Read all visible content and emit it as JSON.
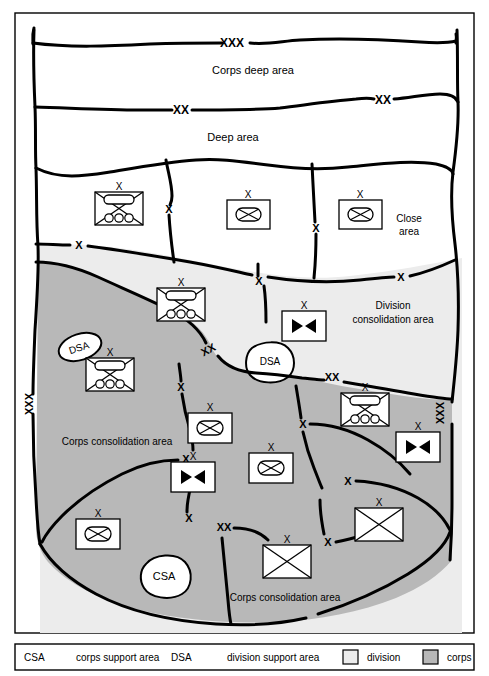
{
  "figure": {
    "background_color": "#ffffff",
    "border_color": "#000000"
  },
  "colors": {
    "division_fill": "#ececec",
    "corps_fill": "#b8b8b8",
    "deep_fill": "#ffffff",
    "line": "#000000",
    "text": "#000000",
    "symbol_fill": "#ffffff"
  },
  "area_labels": [
    {
      "id": "corps-deep-area",
      "text": "Corps deep area",
      "x": 253,
      "y": 70,
      "size": 11
    },
    {
      "id": "deep-area",
      "text": "Deep area",
      "x": 233,
      "y": 137,
      "size": 11
    },
    {
      "id": "close-area-line1",
      "text": "Close",
      "x": 409,
      "y": 219,
      "size": 10
    },
    {
      "id": "close-area-line2",
      "text": "area",
      "x": 409,
      "y": 232,
      "size": 10
    },
    {
      "id": "division-consolidation-line1",
      "text": "Division",
      "x": 393,
      "y": 306,
      "size": 10
    },
    {
      "id": "division-consolidation-line2",
      "text": "consolidation area",
      "x": 393,
      "y": 320,
      "size": 10
    },
    {
      "id": "corps-consolidation-left",
      "text": "Corps consolidation area",
      "x": 117,
      "y": 441,
      "size": 10
    },
    {
      "id": "corps-consolidation-bottom",
      "text": "Corps consolidation area",
      "x": 285,
      "y": 597,
      "size": 10
    }
  ],
  "support_area_blobs": [
    {
      "id": "dsa-left",
      "label": "DSA",
      "cx": 80,
      "cy": 347,
      "rx": 22,
      "ry": 13,
      "rotate": -18
    },
    {
      "id": "dsa-center",
      "label": "DSA",
      "cx": 270,
      "cy": 361,
      "rx": 24,
      "ry": 17,
      "rotate": 0
    },
    {
      "id": "csa-bottom",
      "label": "CSA",
      "cx": 164,
      "cy": 575,
      "rx": 25,
      "ry": 19,
      "rotate": 0
    }
  ],
  "boundary_markers": [
    {
      "id": "xxx-top",
      "text": "XXX",
      "x": 232,
      "y": 43,
      "size": 11,
      "bold": true,
      "rotate": 0
    },
    {
      "id": "xx-deep-left",
      "text": "XX",
      "x": 180,
      "y": 109,
      "size": 11,
      "bold": true,
      "rotate": 0
    },
    {
      "id": "xx-deep-right",
      "text": "XX",
      "x": 381,
      "y": 101,
      "size": 11,
      "bold": true,
      "rotate": 0
    },
    {
      "id": "x-close-left-bdy",
      "text": "X",
      "x": 168,
      "y": 209,
      "size": 10,
      "bold": true,
      "rotate": 0
    },
    {
      "id": "x-close-right-bdy",
      "text": "X",
      "x": 317,
      "y": 228,
      "size": 10,
      "bold": true,
      "rotate": 0
    },
    {
      "id": "x-close-leftedge",
      "text": "X",
      "x": 78,
      "y": 245,
      "size": 10,
      "bold": true,
      "rotate": 0
    },
    {
      "id": "x-div-mid",
      "text": "X",
      "x": 258,
      "y": 282,
      "size": 10,
      "bold": true,
      "rotate": 0
    },
    {
      "id": "x-div-right",
      "text": "X",
      "x": 400,
      "y": 278,
      "size": 10,
      "bold": true,
      "rotate": 0
    },
    {
      "id": "xx-div-left",
      "text": "XX",
      "x": 209,
      "y": 350,
      "size": 10,
      "bold": true,
      "rotate": 0
    },
    {
      "id": "xx-div-right",
      "text": "XX",
      "x": 330,
      "y": 377,
      "size": 10,
      "bold": true,
      "rotate": 0
    },
    {
      "id": "x-corps-left-vert",
      "text": "X",
      "x": 181,
      "y": 387,
      "size": 10,
      "bold": true,
      "rotate": 0
    },
    {
      "id": "x-corps-mid",
      "text": "X",
      "x": 302,
      "y": 425,
      "size": 10,
      "bold": true,
      "rotate": 0
    },
    {
      "id": "x-corps-mid2",
      "text": "X",
      "x": 185,
      "y": 460,
      "size": 10,
      "bold": true,
      "rotate": 0
    },
    {
      "id": "x-corps-lower",
      "text": "X",
      "x": 347,
      "y": 481,
      "size": 10,
      "bold": true,
      "rotate": 0
    },
    {
      "id": "x-corps-bottom-left",
      "text": "X",
      "x": 188,
      "y": 518,
      "size": 10,
      "bold": true,
      "rotate": 0
    },
    {
      "id": "xx-corps-bottom",
      "text": "XX",
      "x": 222,
      "y": 527,
      "size": 10,
      "bold": true,
      "rotate": 0
    },
    {
      "id": "x-corps-bottom-right",
      "text": "X",
      "x": 327,
      "y": 542,
      "size": 10,
      "bold": true,
      "rotate": 0
    },
    {
      "id": "xxx-left-edge",
      "text": "XXX",
      "x": 33,
      "y": 404,
      "size": 10,
      "bold": true,
      "rotate": -90
    },
    {
      "id": "xxx-right-edge",
      "text": "XXX",
      "x": 444,
      "y": 413,
      "size": 10,
      "bold": true,
      "rotate": -90
    }
  ],
  "unit_symbols": [
    {
      "id": "unit-armored-cav-close-left",
      "type": "armored-cavalry",
      "echelon": "X",
      "x": 95,
      "y": 192,
      "w": 48,
      "h": 33
    },
    {
      "id": "unit-mech-inf-close-center",
      "type": "mechanized-infantry",
      "echelon": "X",
      "x": 227,
      "y": 200,
      "w": 43,
      "h": 29
    },
    {
      "id": "unit-mech-inf-close-right",
      "type": "mechanized-infantry",
      "echelon": "X",
      "x": 339,
      "y": 200,
      "w": 43,
      "h": 29
    },
    {
      "id": "unit-armored-cav-div",
      "type": "armored-cavalry",
      "echelon": "X",
      "x": 157,
      "y": 288,
      "w": 48,
      "h": 33
    },
    {
      "id": "unit-cavalry-div",
      "type": "cavalry",
      "echelon": "X",
      "x": 282,
      "y": 311,
      "w": 44,
      "h": 30
    },
    {
      "id": "unit-armored-cav-corps-left",
      "type": "armored-cavalry",
      "echelon": "X",
      "x": 86,
      "y": 358,
      "w": 48,
      "h": 33
    },
    {
      "id": "unit-mech-inf-corps-left",
      "type": "mechanized-infantry",
      "echelon": "X",
      "x": 188,
      "y": 413,
      "w": 44,
      "h": 30
    },
    {
      "id": "unit-cavalry-corps-left",
      "type": "cavalry",
      "echelon": "X",
      "x": 171,
      "y": 462,
      "w": 44,
      "h": 30
    },
    {
      "id": "unit-mech-inf-corps-center",
      "type": "mechanized-infantry",
      "echelon": "X",
      "x": 249,
      "y": 453,
      "w": 44,
      "h": 30
    },
    {
      "id": "unit-armored-cav-corps-right",
      "type": "armored-cavalry",
      "echelon": "X",
      "x": 341,
      "y": 393,
      "w": 48,
      "h": 33
    },
    {
      "id": "unit-cavalry-corps-right",
      "type": "cavalry",
      "echelon": "X",
      "x": 396,
      "y": 432,
      "w": 44,
      "h": 30
    },
    {
      "id": "unit-infantry-corps-bottom-left",
      "type": "infantry-plain",
      "echelon": "X",
      "x": 76,
      "y": 519,
      "w": 44,
      "h": 30
    },
    {
      "id": "unit-infantry-corps-bottom-center",
      "type": "infantry-plain",
      "echelon": "X",
      "x": 263,
      "y": 545,
      "w": 48,
      "h": 33
    },
    {
      "id": "unit-infantry-corps-bottom-right",
      "type": "infantry-plain",
      "echelon": "X",
      "x": 355,
      "y": 508,
      "w": 48,
      "h": 33
    }
  ],
  "legend": {
    "entries": [
      {
        "id": "legend-csa-abbr",
        "text": "CSA",
        "x": 24,
        "y": 658
      },
      {
        "id": "legend-csa-desc",
        "text": "corps support area",
        "x": 76,
        "y": 658
      },
      {
        "id": "legend-dsa-abbr",
        "text": "DSA",
        "x": 171,
        "y": 658
      },
      {
        "id": "legend-dsa-desc",
        "text": "division support area",
        "x": 227,
        "y": 658
      }
    ],
    "swatches": [
      {
        "id": "legend-swatch-division",
        "label": "division",
        "fill": "#ececec",
        "x": 343,
        "y": 650,
        "label_x": 367
      },
      {
        "id": "legend-swatch-corps",
        "label": "corps",
        "fill": "#b8b8b8",
        "x": 423,
        "y": 650,
        "label_x": 447
      }
    ]
  }
}
